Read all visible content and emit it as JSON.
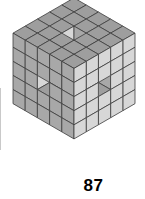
{
  "figure": {
    "kind": "isometric-voxel-cube",
    "grid_size": 5,
    "tile_half_width": 12.2,
    "tile_half_height": 7.05,
    "tile_height": 14.1,
    "origin_x": 74,
    "origin_y": 12,
    "colors": {
      "top_face": "#9e9e9e",
      "left_face": "#a8a8a8",
      "right_face": "#d7d7d7",
      "edge_stroke": "#3c3c3c",
      "background": "#ffffff",
      "edge_artifact": "#c9c9c9"
    },
    "hollow_pattern": {
      "note": "cells removed to form the 3x3-cross tunnel through the centre",
      "tunnel_cross_section": 1,
      "axes": [
        "x",
        "y",
        "z"
      ]
    }
  },
  "caption": {
    "number": "87"
  }
}
